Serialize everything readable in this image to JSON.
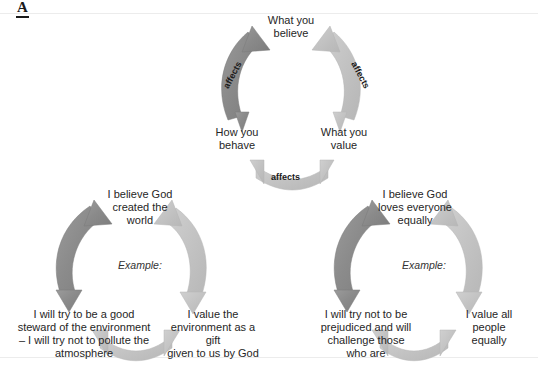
{
  "page": {
    "section_letter": "A"
  },
  "diagrams": [
    {
      "id": "cycle-top",
      "kind": "belief-value-behaviour-cycle",
      "nodes": {
        "believe": "What you\nbelieve",
        "value": "What you\nvalue",
        "behave": "How you\nbehave"
      },
      "edges": {
        "believe_to_value": "affects",
        "value_to_behave": "affects",
        "behave_to_believe": "affects"
      },
      "example_label": ""
    },
    {
      "id": "cycle-bl",
      "kind": "example-cycle-environment",
      "nodes": {
        "believe": "I believe God\ncreated the\nworld",
        "value": "I value the\nenvironment as a gift\ngiven to us by God",
        "behave": "I will try to be a good\nsteward of the environment\n– I will try not to pollute the\natmosphere"
      },
      "edges": {
        "believe_to_value": "",
        "value_to_behave": "",
        "behave_to_believe": ""
      },
      "example_label": "Example:"
    },
    {
      "id": "cycle-br",
      "kind": "example-cycle-equality",
      "nodes": {
        "believe": "I believe God\nloves everyone\nequally",
        "value": "I value all\npeople\nequally",
        "behave": "I will try not to be\nprejudiced and will\nchallenge those\nwho are"
      },
      "edges": {
        "believe_to_value": "",
        "value_to_behave": "",
        "behave_to_believe": ""
      },
      "example_label": "Example:"
    }
  ],
  "colors": {
    "arrow_dark": "#8e8e8e",
    "arrow_dark_edge": "#6f6f6f",
    "arrow_light": "#c4c4c4",
    "arrow_light_edge": "#b0b0b0",
    "text": "#262626",
    "rule": "#ececec",
    "background": "#ffffff"
  }
}
